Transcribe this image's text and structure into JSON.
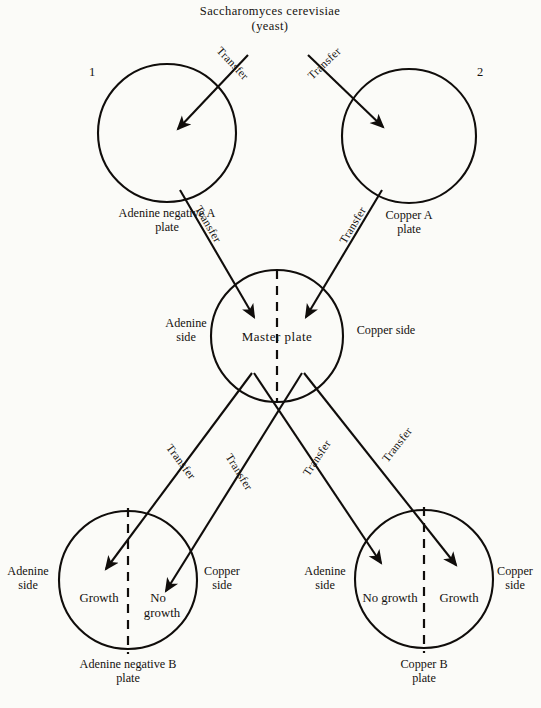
{
  "diagram": {
    "title_line1": "Saccharomyces cerevisiae",
    "title_line2": "(yeast)",
    "numbers": {
      "one": "1",
      "two": "2"
    },
    "transfer_label": "Transfer",
    "plates": {
      "top_left": {
        "name_line1": "Adenine negative A",
        "name_line2": "plate"
      },
      "top_right": {
        "name_line1": "Copper A",
        "name_line2": "plate"
      },
      "master": {
        "name": "Master plate",
        "left_side_line1": "Adenine",
        "left_side_line2": "side",
        "right_side_line1": "Copper side",
        "right_side_line2": ""
      },
      "bottom_left": {
        "name_line1": "Adenine negative B",
        "name_line2": "plate",
        "left_side_line1": "Adenine",
        "left_side_line2": "side",
        "right_side_line1": "Copper",
        "right_side_line2": "side",
        "left_half_result": "Growth",
        "right_half_result_line1": "No",
        "right_half_result_line2": "growth"
      },
      "bottom_right": {
        "name_line1": "Copper B",
        "name_line2": "plate",
        "left_side_line1": "Adenine",
        "left_side_line2": "side",
        "right_side_line1": "Copper",
        "right_side_line2": "side",
        "left_half_result": "No growth",
        "right_half_result": "Growth"
      }
    },
    "transfers": [
      {
        "id": "t1",
        "label": "Transfer"
      },
      {
        "id": "t2",
        "label": "Transfer"
      },
      {
        "id": "t3",
        "label": "Transfer"
      },
      {
        "id": "t4",
        "label": "Transfer"
      },
      {
        "id": "t5",
        "label": "Transfer"
      },
      {
        "id": "t6",
        "label": "Transfer"
      },
      {
        "id": "t7",
        "label": "Transfer"
      },
      {
        "id": "t8",
        "label": "Transfer"
      }
    ],
    "colors": {
      "ink": "#15120f",
      "background": "#fbfbf8"
    }
  }
}
